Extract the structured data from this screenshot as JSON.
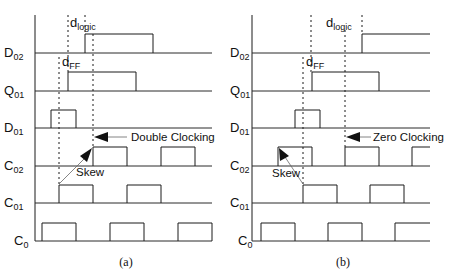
{
  "figure": {
    "panels": [
      {
        "caption": "(a)",
        "axis_x": 35,
        "annotation_arrow": "Double Clocking",
        "skew_label": "Skew",
        "delay_labels": {
          "ff": "d",
          "ff_sub": "FF",
          "logic": "d",
          "logic_sub": "logic"
        },
        "signals": [
          {
            "name": "D",
            "sub": "02",
            "baseline_y": 53,
            "pulses": [
              [
                85,
                153
              ]
            ]
          },
          {
            "name": "Q",
            "sub": "01",
            "baseline_y": 91,
            "pulses": [
              [
                68,
                136
              ]
            ]
          },
          {
            "name": "D",
            "sub": "01",
            "baseline_y": 128,
            "pulses": [
              [
                51,
                76
              ]
            ]
          },
          {
            "name": "C",
            "sub": "02",
            "baseline_y": 166,
            "pulses": [
              [
                93,
                127
              ],
              [
                161,
                195
              ]
            ]
          },
          {
            "name": "C",
            "sub": "01",
            "baseline_y": 203,
            "pulses": [
              [
                59,
                93
              ],
              [
                127,
                161
              ]
            ]
          },
          {
            "name": "C",
            "sub": "0",
            "baseline_y": 241,
            "pulses": [
              [
                42,
                76
              ],
              [
                110,
                144
              ],
              [
                178,
                212
              ]
            ]
          }
        ]
      },
      {
        "caption": "(b)",
        "axis_x": 252,
        "annotation_arrow": "Zero Clocking",
        "skew_label": "Skew",
        "delay_labels": {
          "ff": "d",
          "ff_sub": "FF",
          "logic": "d",
          "logic_sub": "logic"
        },
        "signals": [
          {
            "name": "D",
            "sub": "02",
            "baseline_y": 53,
            "pulses": [
              [
                362,
                430
              ]
            ]
          },
          {
            "name": "Q",
            "sub": "01",
            "baseline_y": 91,
            "pulses": [
              [
                312,
                379
              ]
            ]
          },
          {
            "name": "D",
            "sub": "01",
            "baseline_y": 128,
            "pulses": [
              [
                295,
                320
              ]
            ]
          },
          {
            "name": "C",
            "sub": "02",
            "baseline_y": 166,
            "pulses": [
              [
                278,
                312
              ],
              [
                345,
                379
              ],
              [
                412,
                430
              ]
            ]
          },
          {
            "name": "C",
            "sub": "01",
            "baseline_y": 203,
            "pulses": [
              [
                303,
                337
              ],
              [
                370,
                404
              ]
            ]
          },
          {
            "name": "C",
            "sub": "0",
            "baseline_y": 241,
            "pulses": [
              [
                261,
                295
              ],
              [
                328,
                362
              ],
              [
                395,
                430
              ]
            ]
          }
        ]
      }
    ],
    "colors": {
      "ink": "#1a1a1a",
      "background": "#ffffff"
    }
  }
}
